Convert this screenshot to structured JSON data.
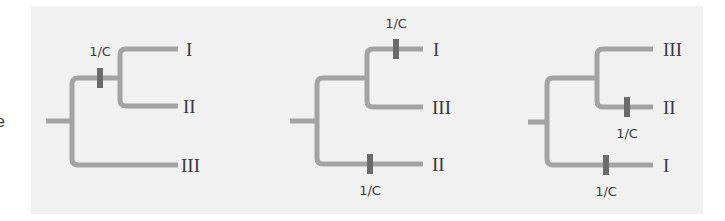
{
  "figure": {
    "edge_fragment": "e",
    "branch_color": "#a3a3a3",
    "marker_color": "#6b6b6b",
    "panel_background": "#f1f1f1",
    "trees": [
      {
        "id": "tree-1",
        "root": {
          "x1": 46,
          "x2": 72,
          "y": 121
        },
        "main_vertical": {
          "x": 72,
          "y1": 78,
          "y2": 165
        },
        "inner_node": {
          "x": 120,
          "y1": 49,
          "y2": 106
        },
        "tips": [
          {
            "label": "I",
            "y": 49,
            "x_from": 120,
            "x_to": 178,
            "label_x": 186
          },
          {
            "label": "II",
            "y": 106,
            "x_from": 120,
            "x_to": 178,
            "label_x": 183
          },
          {
            "label": "III",
            "y": 165,
            "x_from": 72,
            "x_to": 178,
            "label_x": 181
          }
        ],
        "markers": [
          {
            "label": "1/C",
            "x": 100,
            "y": 78,
            "label_x": 100,
            "label_y": 56
          }
        ]
      },
      {
        "id": "tree-2",
        "root": {
          "x1": 290,
          "x2": 317,
          "y": 121
        },
        "main_vertical": {
          "x": 317,
          "y1": 78,
          "y2": 164
        },
        "inner_node": {
          "x": 367,
          "y1": 49,
          "y2": 107
        },
        "tips": [
          {
            "label": "I",
            "y": 49,
            "x_from": 367,
            "x_to": 423,
            "label_x": 433
          },
          {
            "label": "III",
            "y": 107,
            "x_from": 367,
            "x_to": 423,
            "label_x": 432
          },
          {
            "label": "II",
            "y": 164,
            "x_from": 317,
            "x_to": 423,
            "label_x": 432
          }
        ],
        "markers": [
          {
            "label": "1/C",
            "x": 396,
            "y": 49,
            "label_x": 396,
            "label_y": 28
          },
          {
            "label": "1/C",
            "x": 370,
            "y": 164,
            "label_x": 370,
            "label_y": 195
          }
        ]
      },
      {
        "id": "tree-3",
        "root": {
          "x1": 528,
          "x2": 547,
          "y": 122
        },
        "main_vertical": {
          "x": 547,
          "y1": 78,
          "y2": 165
        },
        "inner_node": {
          "x": 597,
          "y1": 49,
          "y2": 107
        },
        "tips": [
          {
            "label": "III",
            "y": 49,
            "x_from": 597,
            "x_to": 653,
            "label_x": 663
          },
          {
            "label": "II",
            "y": 107,
            "x_from": 597,
            "x_to": 653,
            "label_x": 663
          },
          {
            "label": "I",
            "y": 165,
            "x_from": 547,
            "x_to": 653,
            "label_x": 663
          }
        ],
        "markers": [
          {
            "label": "1/C",
            "x": 627,
            "y": 107,
            "label_x": 627,
            "label_y": 138
          },
          {
            "label": "1/C",
            "x": 606,
            "y": 165,
            "label_x": 606,
            "label_y": 196
          }
        ]
      }
    ]
  }
}
